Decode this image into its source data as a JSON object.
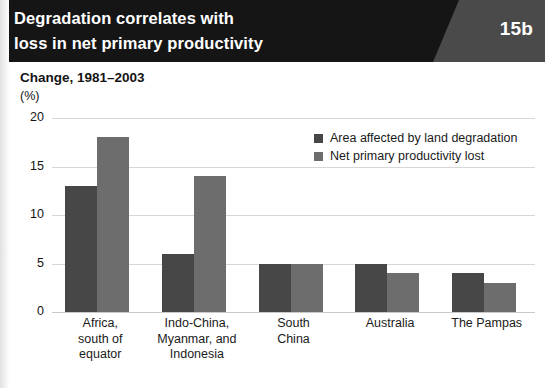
{
  "header": {
    "title_lines": [
      "Degradation correlates with",
      "loss in net primary productivity"
    ],
    "badge": "15b",
    "band_color": "#151515",
    "badge_panel_color": "#4a4a4a"
  },
  "subtitle": "Change, 1981–2003",
  "unit": "(%)",
  "legend": {
    "items": [
      {
        "label": "Area affected by land degradation",
        "color": "#474747"
      },
      {
        "label": "Net primary productivity lost",
        "color": "#6d6d6d"
      }
    ]
  },
  "chart_data": {
    "type": "bar",
    "title": "Degradation correlates with loss in net primary productivity",
    "subtitle": "Change, 1981–2003",
    "xlabel": "",
    "ylabel": "(%)",
    "ylim": [
      0,
      20
    ],
    "yticks": [
      0,
      5,
      10,
      15,
      20
    ],
    "ytick_labels": [
      "0",
      "5",
      "10",
      "15",
      "20"
    ],
    "grid": true,
    "legend_position": "top-right",
    "categories": [
      "Africa, south of equator",
      "Indo-China, Myanmar, and Indonesia",
      "South China",
      "Australia",
      "The Pampas"
    ],
    "category_label_lines": [
      [
        "Africa,",
        "south of",
        "equator"
      ],
      [
        "Indo-China,",
        "Myanmar, and",
        "Indonesia"
      ],
      [
        "South",
        "China"
      ],
      [
        "Australia"
      ],
      [
        "The Pampas"
      ]
    ],
    "series": [
      {
        "name": "Area affected by land degradation",
        "color": "#474747",
        "values": [
          13,
          6,
          5,
          5,
          4
        ]
      },
      {
        "name": "Net primary productivity lost",
        "color": "#6d6d6d",
        "values": [
          18,
          14,
          5,
          4,
          3
        ]
      }
    ]
  }
}
